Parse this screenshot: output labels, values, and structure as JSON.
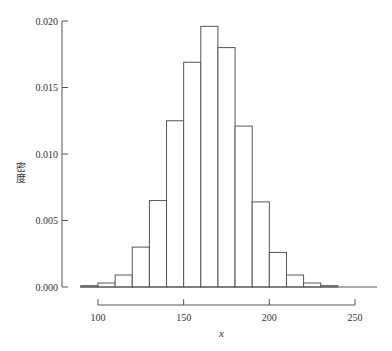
{
  "chart_data": {
    "type": "bar",
    "subtype": "histogram",
    "title": "",
    "xlabel": "x",
    "ylabel": "密度",
    "bin_width": 10,
    "bin_edges": [
      90,
      100,
      110,
      120,
      130,
      140,
      150,
      160,
      170,
      180,
      190,
      200,
      210,
      220,
      230,
      240
    ],
    "categories": [
      "90-100",
      "100-110",
      "110-120",
      "120-130",
      "130-140",
      "140-150",
      "150-160",
      "160-170",
      "170-180",
      "180-190",
      "190-200",
      "200-210",
      "210-220",
      "220-230",
      "230-240"
    ],
    "values": [
      0.0001,
      0.0003,
      0.0009,
      0.003,
      0.0065,
      0.0125,
      0.0169,
      0.0196,
      0.018,
      0.0121,
      0.0064,
      0.0026,
      0.0009,
      0.0003,
      0.0001
    ],
    "xlim": [
      85,
      265
    ],
    "ylim": [
      0,
      0.02
    ],
    "x_ticks": [
      "100",
      "150",
      "200",
      "250"
    ],
    "x_tick_values": [
      100,
      150,
      200,
      250
    ],
    "y_ticks": [
      "0.000",
      "0.005",
      "0.010",
      "0.015",
      "0.020"
    ],
    "y_tick_values": [
      0,
      0.005,
      0.01,
      0.015,
      0.02
    ],
    "grid": false,
    "legend": null,
    "bar_fill": "#ffffff",
    "bar_stroke": "#555555",
    "axis_color": "#555555"
  }
}
